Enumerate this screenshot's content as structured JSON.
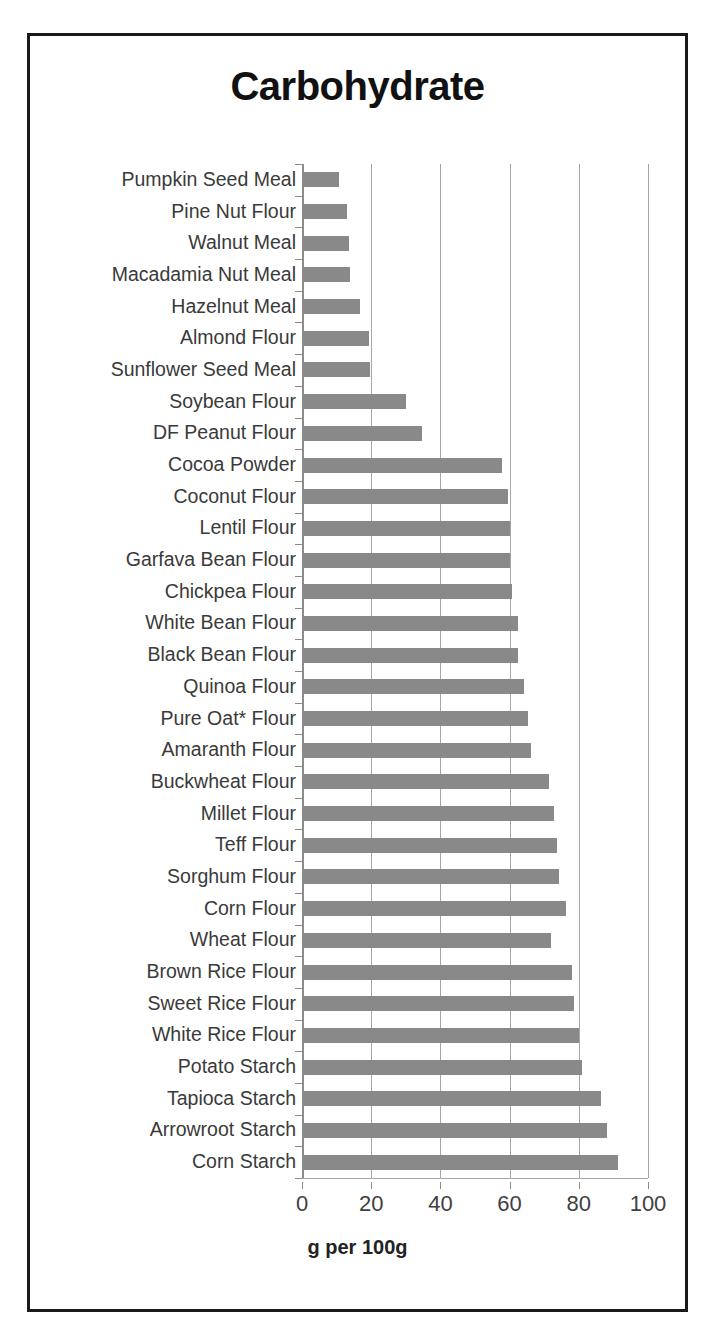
{
  "chart_data": {
    "type": "bar",
    "orientation": "horizontal",
    "title": "Carbohydrate",
    "xlabel": "g per 100g",
    "ylabel": "",
    "xlim": [
      0,
      100
    ],
    "xticks": [
      0,
      20,
      40,
      60,
      80,
      100
    ],
    "xtick_labels": [
      "0",
      "20",
      "40",
      "60",
      "80",
      "100"
    ],
    "grid": "vertical",
    "legend": "none",
    "bar_color": "#898989",
    "categories": [
      "Pumpkin Seed Meal",
      "Pine Nut Flour",
      "Walnut Meal",
      "Macadamia Nut Meal",
      "Hazelnut Meal",
      "Almond Flour",
      "Sunflower Seed Meal",
      "Soybean Flour",
      "DF Peanut Flour",
      "Cocoa Powder",
      "Coconut Flour",
      "Lentil Flour",
      "Garfava Bean Flour",
      "Chickpea Flour",
      "White Bean Flour",
      "Black Bean Flour",
      "Quinoa Flour",
      "Pure Oat* Flour",
      "Amaranth Flour",
      "Buckwheat Flour",
      "Millet Flour",
      "Teff Flour",
      "Sorghum Flour",
      "Corn Flour",
      "Wheat Flour",
      "Brown Rice Flour",
      "Sweet Rice Flour",
      "White Rice Flour",
      "Potato Starch",
      "Tapioca Starch",
      "Arrowroot Starch",
      "Corn Starch"
    ],
    "values": [
      10.7,
      13.1,
      13.7,
      13.8,
      16.7,
      19.5,
      19.6,
      30.2,
      34.7,
      57.9,
      59.5,
      60.1,
      60.2,
      60.7,
      62.4,
      62.4,
      64.2,
      65.2,
      66.2,
      71.5,
      72.8,
      73.6,
      74.4,
      76.3,
      71.9,
      78.0,
      78.6,
      80.1,
      81.0,
      86.3,
      88.1,
      91.3
    ]
  }
}
